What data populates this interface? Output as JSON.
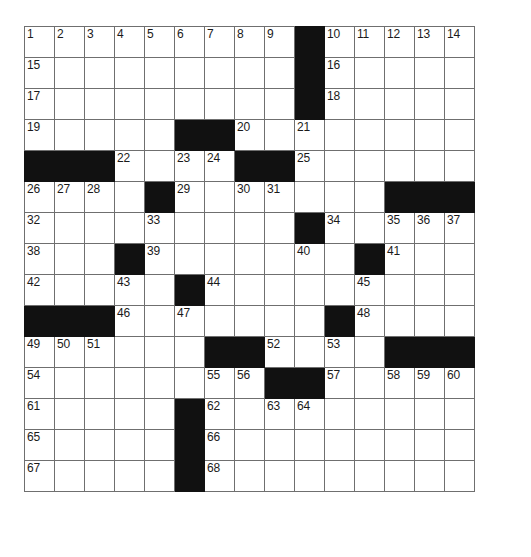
{
  "puzzle": {
    "title": "Crossword Grid",
    "rows": 15,
    "cols": 15,
    "cell_size_px": 31,
    "colors": {
      "block": "#111111",
      "grid_line": "#6f6f6f",
      "background": "#ffffff",
      "number": "#1a1a1a"
    },
    "numbers_visible": [
      1,
      2,
      3,
      4,
      5,
      6,
      7,
      8,
      9,
      10,
      11,
      12,
      13,
      14,
      15,
      16,
      17,
      18,
      19,
      20,
      21,
      22,
      23,
      24,
      25,
      26,
      27,
      28,
      29,
      30,
      31,
      32,
      33,
      34,
      35,
      36,
      37,
      38,
      39,
      40,
      41,
      42,
      43,
      44,
      45,
      46,
      47,
      48,
      49,
      50,
      51,
      52,
      53,
      54,
      55,
      56,
      57,
      58,
      59,
      60,
      61,
      62,
      63,
      64,
      65,
      66,
      67,
      68
    ],
    "grid": [
      [
        {
          "block": false,
          "num": "1"
        },
        {
          "block": false,
          "num": "2"
        },
        {
          "block": false,
          "num": "3"
        },
        {
          "block": false,
          "num": "4"
        },
        {
          "block": false,
          "num": "5"
        },
        {
          "block": false,
          "num": "6"
        },
        {
          "block": false,
          "num": "7"
        },
        {
          "block": false,
          "num": "8"
        },
        {
          "block": false,
          "num": "9"
        },
        {
          "block": true,
          "num": ""
        },
        {
          "block": false,
          "num": "10"
        },
        {
          "block": false,
          "num": "11"
        },
        {
          "block": false,
          "num": "12"
        },
        {
          "block": false,
          "num": "13"
        },
        {
          "block": false,
          "num": "14"
        }
      ],
      [
        {
          "block": false,
          "num": "15"
        },
        {
          "block": false,
          "num": ""
        },
        {
          "block": false,
          "num": ""
        },
        {
          "block": false,
          "num": ""
        },
        {
          "block": false,
          "num": ""
        },
        {
          "block": false,
          "num": ""
        },
        {
          "block": false,
          "num": ""
        },
        {
          "block": false,
          "num": ""
        },
        {
          "block": false,
          "num": ""
        },
        {
          "block": true,
          "num": ""
        },
        {
          "block": false,
          "num": "16"
        },
        {
          "block": false,
          "num": ""
        },
        {
          "block": false,
          "num": ""
        },
        {
          "block": false,
          "num": ""
        },
        {
          "block": false,
          "num": ""
        }
      ],
      [
        {
          "block": false,
          "num": "17"
        },
        {
          "block": false,
          "num": ""
        },
        {
          "block": false,
          "num": ""
        },
        {
          "block": false,
          "num": ""
        },
        {
          "block": false,
          "num": ""
        },
        {
          "block": false,
          "num": ""
        },
        {
          "block": false,
          "num": ""
        },
        {
          "block": false,
          "num": ""
        },
        {
          "block": false,
          "num": ""
        },
        {
          "block": true,
          "num": ""
        },
        {
          "block": false,
          "num": "18"
        },
        {
          "block": false,
          "num": ""
        },
        {
          "block": false,
          "num": ""
        },
        {
          "block": false,
          "num": ""
        },
        {
          "block": false,
          "num": ""
        }
      ],
      [
        {
          "block": false,
          "num": "19"
        },
        {
          "block": false,
          "num": ""
        },
        {
          "block": false,
          "num": ""
        },
        {
          "block": false,
          "num": ""
        },
        {
          "block": false,
          "num": ""
        },
        {
          "block": true,
          "num": ""
        },
        {
          "block": true,
          "num": ""
        },
        {
          "block": false,
          "num": "20"
        },
        {
          "block": false,
          "num": ""
        },
        {
          "block": false,
          "num": "21"
        },
        {
          "block": false,
          "num": ""
        },
        {
          "block": false,
          "num": ""
        },
        {
          "block": false,
          "num": ""
        },
        {
          "block": false,
          "num": ""
        },
        {
          "block": false,
          "num": ""
        }
      ],
      [
        {
          "block": true,
          "num": ""
        },
        {
          "block": true,
          "num": ""
        },
        {
          "block": true,
          "num": ""
        },
        {
          "block": false,
          "num": "22"
        },
        {
          "block": false,
          "num": ""
        },
        {
          "block": false,
          "num": "23"
        },
        {
          "block": false,
          "num": "24"
        },
        {
          "block": true,
          "num": ""
        },
        {
          "block": true,
          "num": ""
        },
        {
          "block": false,
          "num": "25"
        },
        {
          "block": false,
          "num": ""
        },
        {
          "block": false,
          "num": ""
        },
        {
          "block": false,
          "num": ""
        },
        {
          "block": false,
          "num": ""
        },
        {
          "block": false,
          "num": ""
        }
      ],
      [
        {
          "block": false,
          "num": "26"
        },
        {
          "block": false,
          "num": "27"
        },
        {
          "block": false,
          "num": "28"
        },
        {
          "block": false,
          "num": ""
        },
        {
          "block": true,
          "num": ""
        },
        {
          "block": false,
          "num": "29"
        },
        {
          "block": false,
          "num": ""
        },
        {
          "block": false,
          "num": "30"
        },
        {
          "block": false,
          "num": "31"
        },
        {
          "block": false,
          "num": ""
        },
        {
          "block": false,
          "num": ""
        },
        {
          "block": false,
          "num": ""
        },
        {
          "block": true,
          "num": ""
        },
        {
          "block": true,
          "num": ""
        },
        {
          "block": true,
          "num": ""
        }
      ],
      [
        {
          "block": false,
          "num": "32"
        },
        {
          "block": false,
          "num": ""
        },
        {
          "block": false,
          "num": ""
        },
        {
          "block": false,
          "num": ""
        },
        {
          "block": false,
          "num": "33"
        },
        {
          "block": false,
          "num": ""
        },
        {
          "block": false,
          "num": ""
        },
        {
          "block": false,
          "num": ""
        },
        {
          "block": false,
          "num": ""
        },
        {
          "block": true,
          "num": ""
        },
        {
          "block": false,
          "num": "34"
        },
        {
          "block": false,
          "num": ""
        },
        {
          "block": false,
          "num": "35"
        },
        {
          "block": false,
          "num": "36"
        },
        {
          "block": false,
          "num": "37"
        }
      ],
      [
        {
          "block": false,
          "num": "38"
        },
        {
          "block": false,
          "num": ""
        },
        {
          "block": false,
          "num": ""
        },
        {
          "block": true,
          "num": ""
        },
        {
          "block": false,
          "num": "39"
        },
        {
          "block": false,
          "num": ""
        },
        {
          "block": false,
          "num": ""
        },
        {
          "block": false,
          "num": ""
        },
        {
          "block": false,
          "num": ""
        },
        {
          "block": false,
          "num": "40"
        },
        {
          "block": false,
          "num": ""
        },
        {
          "block": true,
          "num": ""
        },
        {
          "block": false,
          "num": "41"
        },
        {
          "block": false,
          "num": ""
        },
        {
          "block": false,
          "num": ""
        }
      ],
      [
        {
          "block": false,
          "num": "42"
        },
        {
          "block": false,
          "num": ""
        },
        {
          "block": false,
          "num": ""
        },
        {
          "block": false,
          "num": "43"
        },
        {
          "block": false,
          "num": ""
        },
        {
          "block": true,
          "num": ""
        },
        {
          "block": false,
          "num": "44"
        },
        {
          "block": false,
          "num": ""
        },
        {
          "block": false,
          "num": ""
        },
        {
          "block": false,
          "num": ""
        },
        {
          "block": false,
          "num": ""
        },
        {
          "block": false,
          "num": "45"
        },
        {
          "block": false,
          "num": ""
        },
        {
          "block": false,
          "num": ""
        },
        {
          "block": false,
          "num": ""
        }
      ],
      [
        {
          "block": true,
          "num": ""
        },
        {
          "block": true,
          "num": ""
        },
        {
          "block": true,
          "num": ""
        },
        {
          "block": false,
          "num": "46"
        },
        {
          "block": false,
          "num": ""
        },
        {
          "block": false,
          "num": "47"
        },
        {
          "block": false,
          "num": ""
        },
        {
          "block": false,
          "num": ""
        },
        {
          "block": false,
          "num": ""
        },
        {
          "block": false,
          "num": ""
        },
        {
          "block": true,
          "num": ""
        },
        {
          "block": false,
          "num": "48"
        },
        {
          "block": false,
          "num": ""
        },
        {
          "block": false,
          "num": ""
        },
        {
          "block": false,
          "num": ""
        }
      ],
      [
        {
          "block": false,
          "num": "49"
        },
        {
          "block": false,
          "num": "50"
        },
        {
          "block": false,
          "num": "51"
        },
        {
          "block": false,
          "num": ""
        },
        {
          "block": false,
          "num": ""
        },
        {
          "block": false,
          "num": ""
        },
        {
          "block": true,
          "num": ""
        },
        {
          "block": true,
          "num": ""
        },
        {
          "block": false,
          "num": "52"
        },
        {
          "block": false,
          "num": ""
        },
        {
          "block": false,
          "num": "53"
        },
        {
          "block": false,
          "num": ""
        },
        {
          "block": true,
          "num": ""
        },
        {
          "block": true,
          "num": ""
        },
        {
          "block": true,
          "num": ""
        }
      ],
      [
        {
          "block": false,
          "num": "54"
        },
        {
          "block": false,
          "num": ""
        },
        {
          "block": false,
          "num": ""
        },
        {
          "block": false,
          "num": ""
        },
        {
          "block": false,
          "num": ""
        },
        {
          "block": false,
          "num": ""
        },
        {
          "block": false,
          "num": "55"
        },
        {
          "block": false,
          "num": "56"
        },
        {
          "block": true,
          "num": ""
        },
        {
          "block": true,
          "num": ""
        },
        {
          "block": false,
          "num": "57"
        },
        {
          "block": false,
          "num": ""
        },
        {
          "block": false,
          "num": "58"
        },
        {
          "block": false,
          "num": "59"
        },
        {
          "block": false,
          "num": "60"
        }
      ],
      [
        {
          "block": false,
          "num": "61"
        },
        {
          "block": false,
          "num": ""
        },
        {
          "block": false,
          "num": ""
        },
        {
          "block": false,
          "num": ""
        },
        {
          "block": false,
          "num": ""
        },
        {
          "block": true,
          "num": ""
        },
        {
          "block": false,
          "num": "62"
        },
        {
          "block": false,
          "num": ""
        },
        {
          "block": false,
          "num": "63"
        },
        {
          "block": false,
          "num": "64"
        },
        {
          "block": false,
          "num": ""
        },
        {
          "block": false,
          "num": ""
        },
        {
          "block": false,
          "num": ""
        },
        {
          "block": false,
          "num": ""
        },
        {
          "block": false,
          "num": ""
        }
      ],
      [
        {
          "block": false,
          "num": "65"
        },
        {
          "block": false,
          "num": ""
        },
        {
          "block": false,
          "num": ""
        },
        {
          "block": false,
          "num": ""
        },
        {
          "block": false,
          "num": ""
        },
        {
          "block": true,
          "num": ""
        },
        {
          "block": false,
          "num": "66"
        },
        {
          "block": false,
          "num": ""
        },
        {
          "block": false,
          "num": ""
        },
        {
          "block": false,
          "num": ""
        },
        {
          "block": false,
          "num": ""
        },
        {
          "block": false,
          "num": ""
        },
        {
          "block": false,
          "num": ""
        },
        {
          "block": false,
          "num": ""
        },
        {
          "block": false,
          "num": ""
        }
      ],
      [
        {
          "block": false,
          "num": "67"
        },
        {
          "block": false,
          "num": ""
        },
        {
          "block": false,
          "num": ""
        },
        {
          "block": false,
          "num": ""
        },
        {
          "block": false,
          "num": ""
        },
        {
          "block": true,
          "num": ""
        },
        {
          "block": false,
          "num": "68"
        },
        {
          "block": false,
          "num": ""
        },
        {
          "block": false,
          "num": ""
        },
        {
          "block": false,
          "num": ""
        },
        {
          "block": false,
          "num": ""
        },
        {
          "block": false,
          "num": ""
        },
        {
          "block": false,
          "num": ""
        },
        {
          "block": false,
          "num": ""
        },
        {
          "block": false,
          "num": ""
        }
      ]
    ]
  }
}
